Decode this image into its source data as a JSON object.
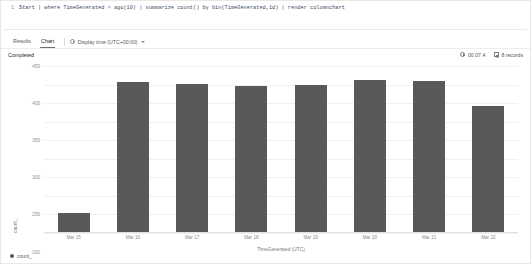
{
  "editor": {
    "line_number": "1",
    "query": "Start | where TimeGenerated > ago(10) | summarize count() by bin(TimeGenerated,1d) | render columnchart"
  },
  "tabs": [
    {
      "label": "Results",
      "active": false
    },
    {
      "label": "Chart",
      "active": true
    }
  ],
  "timezone_picker": {
    "label": "Display time (UTC+00:00)",
    "info_icon": "info-icon",
    "chevron_icon": "chevron-down-icon"
  },
  "status": {
    "text": "Completed",
    "duration": "00:07.4",
    "duration_icon": "clock-icon",
    "records": "8 records",
    "records_icon": "rows-icon"
  },
  "legend": {
    "series_label": "count_",
    "marker_color": "#595959"
  },
  "chart_data": {
    "type": "bar",
    "title": "",
    "xlabel": "TimeGenerated (UTC)",
    "ylabel": "count_",
    "categories": [
      "Mar 15",
      "Mar 16",
      "Mar 17",
      "Mar 18",
      "Mar 19",
      "Mar 20",
      "Mar 21",
      "Mar 22"
    ],
    "values": [
      50,
      405,
      400,
      393,
      397,
      410,
      408,
      340
    ],
    "series": [
      {
        "name": "count_",
        "color": "#595959",
        "values": [
          50,
          405,
          400,
          393,
          397,
          410,
          408,
          340
        ]
      }
    ],
    "ylim": [
      0,
      450
    ],
    "yticks": [
      450,
      400,
      350,
      300,
      250,
      200,
      150,
      100,
      50,
      0
    ],
    "ytick_labels": [
      "450",
      "400",
      "350",
      "300",
      "250",
      "200",
      "150",
      "100",
      "50",
      "0"
    ],
    "grid": true,
    "legend_position": "bottom-left"
  }
}
